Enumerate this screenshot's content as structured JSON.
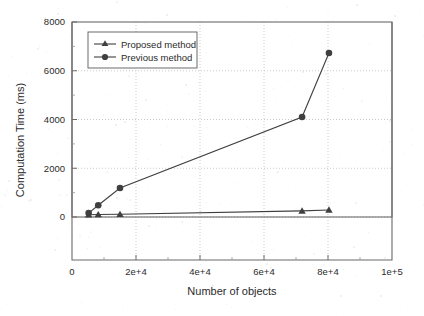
{
  "chart_data": {
    "type": "line",
    "title": "",
    "xlabel": "Number of objects",
    "ylabel": "Computation Time (ms)",
    "xlim": [
      0,
      100000
    ],
    "ylim": [
      0,
      8000
    ],
    "xticks": [
      0,
      20000,
      40000,
      60000,
      80000,
      100000
    ],
    "xtick_labels": [
      "0",
      "2e+4",
      "4e+4",
      "6e+4",
      "8e+4",
      "1e+5"
    ],
    "yticks": [
      0,
      2000,
      4000,
      6000,
      8000
    ],
    "ytick_labels": [
      "0",
      "2000",
      "4000",
      "6000",
      "8000"
    ],
    "grid": true,
    "grid_style": "dotted",
    "legend_position": "upper-left",
    "series": [
      {
        "name": "Proposed method",
        "marker": "triangle",
        "color": "#3f3f3f",
        "x": [
          5200,
          8200,
          15000,
          71900,
          80300
        ],
        "y": [
          90,
          100,
          110,
          250,
          290
        ]
      },
      {
        "name": "Previous method",
        "marker": "circle",
        "color": "#3f3f3f",
        "x": [
          5200,
          8200,
          15000,
          71900,
          80300
        ],
        "y": [
          160,
          480,
          1190,
          4100,
          6730
        ]
      }
    ]
  },
  "legend": {
    "items": [
      {
        "label": "Proposed method",
        "marker": "triangle-marker"
      },
      {
        "label": "Previous method",
        "marker": "circle-marker"
      }
    ]
  },
  "axes": {
    "x_title": "Number of objects",
    "y_title": "Computation Time (ms)"
  },
  "colors": {
    "line": "#3f3f3f",
    "axis": "#555555",
    "grid": "#c0c0c0",
    "text": "#2b2b2b",
    "background": "#ffffff"
  }
}
